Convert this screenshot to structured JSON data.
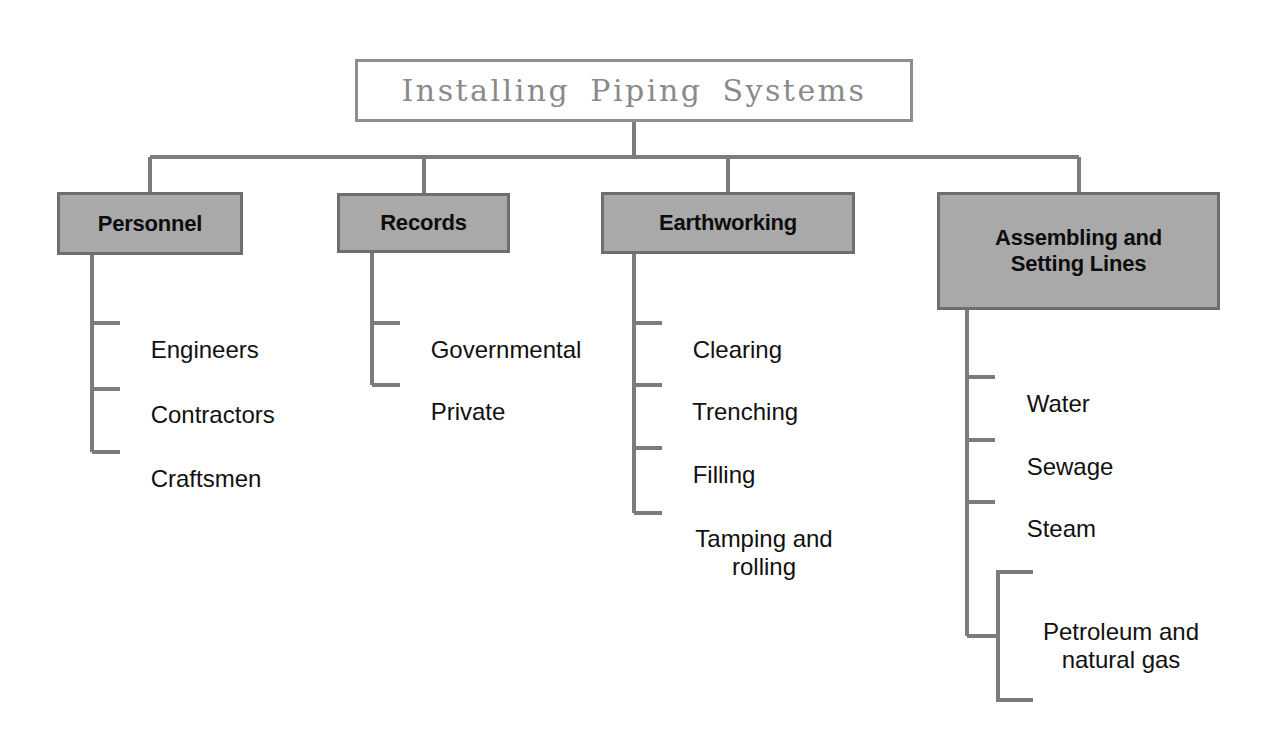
{
  "page": {
    "title": "Installing Piping Systems",
    "width": 1287,
    "height": 742,
    "background": "#ffffff"
  },
  "colors": {
    "box_fill": "#a9a9a9",
    "box_border": "#6e6e6e",
    "title_border": "#8e8e8e",
    "title_text": "#8a8a8a",
    "connector": "#7c7c7c",
    "leaf_text": "#111111",
    "box_text": "#0d0d0d"
  },
  "root": {
    "label": "Installing Piping Systems"
  },
  "branches": [
    {
      "id": "personnel",
      "label": "Personnel",
      "children": [
        {
          "label": "Engineers"
        },
        {
          "label": "Contractors"
        },
        {
          "label": "Craftsmen"
        }
      ]
    },
    {
      "id": "records",
      "label": "Records",
      "children": [
        {
          "label": "Governmental"
        },
        {
          "label": "Private"
        }
      ]
    },
    {
      "id": "earthworking",
      "label": "Earthworking",
      "children": [
        {
          "label": "Clearing"
        },
        {
          "label": "Trenching"
        },
        {
          "label": "Filling"
        },
        {
          "label": "Tamping and\nrolling"
        }
      ]
    },
    {
      "id": "assembling-and-setting-lines",
      "label": "Assembling and\nSetting Lines",
      "children": [
        {
          "label": "Water"
        },
        {
          "label": "Sewage"
        },
        {
          "label": "Steam"
        },
        {
          "label": "Petroleum and\nnatural gas"
        }
      ]
    }
  ]
}
